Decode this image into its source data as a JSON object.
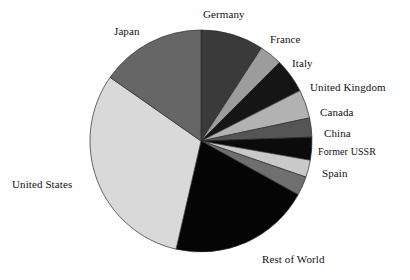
{
  "chart_data": {
    "type": "pie",
    "title": "",
    "subtitle": "",
    "xlabel": "",
    "ylabel": "",
    "legend_position": "none",
    "labels_position": "outside-callout",
    "grid": false,
    "start_angle_deg": 0,
    "direction": "clockwise",
    "categories": [
      "Germany",
      "France",
      "Italy",
      "United Kingdom",
      "Canada",
      "China",
      "Former USSR",
      "Spain",
      "Rest of World",
      "United States",
      "Japan"
    ],
    "values": [
      9.2,
      3.3,
      5.0,
      4.2,
      2.8,
      3.3,
      2.5,
      2.8,
      20.6,
      31.1,
      15.2
    ],
    "slices": [
      {
        "label": "Germany",
        "value": 9.2,
        "start_deg": 0.0,
        "end_deg": 33.0,
        "color": "#3a3a3a"
      },
      {
        "label": "France",
        "value": 3.3,
        "start_deg": 33.0,
        "end_deg": 45.0,
        "color": "#9c9c9c"
      },
      {
        "label": "Italy",
        "value": 5.0,
        "start_deg": 45.0,
        "end_deg": 63.0,
        "color": "#151515"
      },
      {
        "label": "United Kingdom",
        "value": 4.2,
        "start_deg": 63.0,
        "end_deg": 78.0,
        "color": "#b2b2b2"
      },
      {
        "label": "Canada",
        "value": 2.8,
        "start_deg": 78.0,
        "end_deg": 88.0,
        "color": "#555555"
      },
      {
        "label": "China",
        "value": 3.3,
        "start_deg": 88.0,
        "end_deg": 100.0,
        "color": "#0b0b0b"
      },
      {
        "label": "Former USSR",
        "value": 2.5,
        "start_deg": 100.0,
        "end_deg": 109.0,
        "color": "#c9c9c9"
      },
      {
        "label": "Spain",
        "value": 2.8,
        "start_deg": 109.0,
        "end_deg": 119.0,
        "color": "#6f6f6f"
      },
      {
        "label": "Rest of World",
        "value": 20.6,
        "start_deg": 119.0,
        "end_deg": 193.0,
        "color": "#050505"
      },
      {
        "label": "United States",
        "value": 31.1,
        "start_deg": 193.0,
        "end_deg": 305.0,
        "color": "#d9d9d9"
      },
      {
        "label": "Japan",
        "value": 15.2,
        "start_deg": 305.0,
        "end_deg": 360.0,
        "color": "#666666"
      }
    ],
    "geometry": {
      "cx": 201,
      "cy": 141,
      "r": 111
    }
  },
  "labels": {
    "germany": "Germany",
    "france": "France",
    "italy": "Italy",
    "united_kingdom": "United Kingdom",
    "canada": "Canada",
    "china": "China",
    "former_ussr": "Former USSR",
    "spain": "Spain",
    "rest_of_world": "Rest of World",
    "united_states": "United States",
    "japan": "Japan"
  },
  "label_positions": {
    "germany": {
      "left": 203,
      "top": 8
    },
    "france": {
      "left": 270,
      "top": 33
    },
    "italy": {
      "left": 292,
      "top": 57
    },
    "united_kingdom": {
      "left": 310,
      "top": 81
    },
    "canada": {
      "left": 320,
      "top": 106
    },
    "china": {
      "left": 324,
      "top": 127
    },
    "former_ussr": {
      "left": 318,
      "top": 146
    },
    "spain": {
      "left": 322,
      "top": 167
    },
    "rest_of_world": {
      "left": 262,
      "top": 253
    },
    "united_states": {
      "left": 12,
      "top": 178
    },
    "japan": {
      "left": 114,
      "top": 25
    }
  }
}
